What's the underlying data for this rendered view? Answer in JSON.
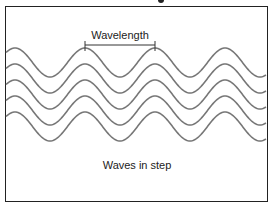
{
  "diagram": {
    "wavelength_label": "Wavelength",
    "caption": "Waves in step",
    "wave_color": "#777777",
    "frame_color": "#222222",
    "waves": {
      "count": 5,
      "wavelength_px": 70,
      "amplitude_px": 14.5,
      "first_crest_y": 48,
      "vertical_spacing_px": 16,
      "crest_x": [
        15,
        85,
        155,
        225
      ]
    },
    "wavelength_marker": {
      "x_start": 85,
      "x_end": 155,
      "y": 45
    }
  }
}
